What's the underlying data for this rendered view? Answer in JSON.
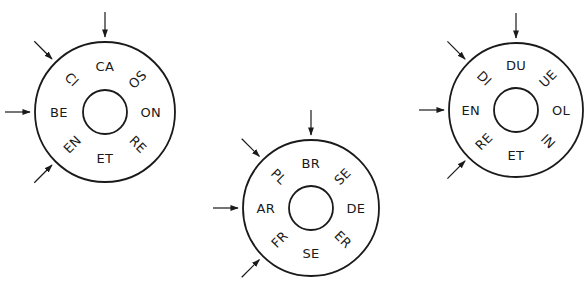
{
  "colors": {
    "stroke": "#1a1a1a",
    "background": "#ffffff"
  },
  "wheels": [
    {
      "id": "wheel-1",
      "center": [
        105,
        112
      ],
      "outer_r": 70,
      "inner_r": 22,
      "label_r": 46,
      "labels": [
        {
          "pos": "top",
          "text": "CA"
        },
        {
          "pos": "top-right",
          "text": "OS"
        },
        {
          "pos": "right",
          "text": "ON"
        },
        {
          "pos": "bottom-right",
          "text": "RE"
        },
        {
          "pos": "bottom",
          "text": "ET"
        },
        {
          "pos": "bottom-left",
          "text": "EN"
        },
        {
          "pos": "left",
          "text": "BE"
        },
        {
          "pos": "top-left",
          "text": "CI"
        }
      ],
      "arrows": [
        "top",
        "top-left",
        "left",
        "bottom-left"
      ]
    },
    {
      "id": "wheel-2",
      "center": [
        311,
        208
      ],
      "outer_r": 68,
      "inner_r": 22,
      "label_r": 45,
      "labels": [
        {
          "pos": "top",
          "text": "BR"
        },
        {
          "pos": "top-right",
          "text": "SE"
        },
        {
          "pos": "right",
          "text": "DE"
        },
        {
          "pos": "bottom-right",
          "text": "ER"
        },
        {
          "pos": "bottom",
          "text": "SE"
        },
        {
          "pos": "bottom-left",
          "text": "FR"
        },
        {
          "pos": "left",
          "text": "AR"
        },
        {
          "pos": "top-left",
          "text": "PL"
        }
      ],
      "arrows": [
        "top",
        "top-left",
        "left",
        "bottom-left"
      ]
    },
    {
      "id": "wheel-3",
      "center": [
        516,
        110
      ],
      "outer_r": 67,
      "inner_r": 22,
      "label_r": 45,
      "labels": [
        {
          "pos": "top",
          "text": "DU"
        },
        {
          "pos": "top-right",
          "text": "UE"
        },
        {
          "pos": "right",
          "text": "OL"
        },
        {
          "pos": "bottom-right",
          "text": "IN"
        },
        {
          "pos": "bottom",
          "text": "ET"
        },
        {
          "pos": "bottom-left",
          "text": "RE"
        },
        {
          "pos": "left",
          "text": "EN"
        },
        {
          "pos": "top-left",
          "text": "DI"
        }
      ],
      "arrows": [
        "top",
        "top-left",
        "left",
        "bottom-left"
      ]
    }
  ]
}
